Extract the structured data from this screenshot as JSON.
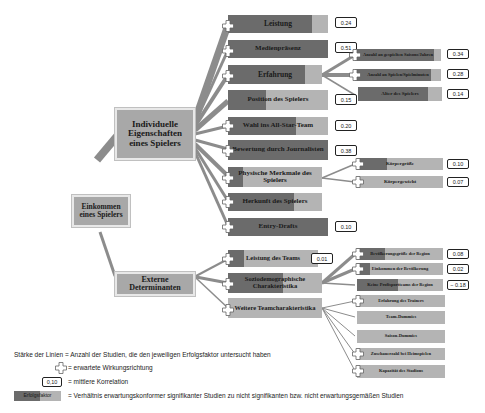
{
  "diagram": {
    "root": {
      "label": "Einkommen eines Spielers"
    },
    "branches": [
      {
        "label": "Individuelle Eigenschaften eines Spielers",
        "children": [
          {
            "label": "Leistung",
            "correlation": "0.24",
            "expected_direction": true
          },
          {
            "label": "Medienpräsenz",
            "correlation": "0.51",
            "expected_direction": true
          },
          {
            "label": "Erfahrung",
            "correlation": null,
            "expected_direction": true,
            "children": [
              {
                "label": "Anzahl an gespielten Saisons/Jahren",
                "correlation": "0.34",
                "expected_direction": true
              },
              {
                "label": "Anzahl an Spielen/Spielminuten",
                "correlation": "0.28",
                "expected_direction": true
              },
              {
                "label": "Alter des Spielers",
                "correlation": "0.14",
                "expected_direction": false
              }
            ]
          },
          {
            "label": "Position des Spielers",
            "correlation": "0.15",
            "expected_direction": false
          },
          {
            "label": "Wahl ins All-Star-Team",
            "correlation": "0.20",
            "expected_direction": true
          },
          {
            "label": "Bewertung durch Journalisten",
            "correlation": "0.38",
            "expected_direction": true
          },
          {
            "label": "Physische Merkmale des Spielers",
            "correlation": null,
            "expected_direction": true,
            "children": [
              {
                "label": "Körpergröße",
                "correlation": "0.10",
                "expected_direction": true
              },
              {
                "label": "Körpergewicht",
                "correlation": "0.07",
                "expected_direction": true
              }
            ]
          },
          {
            "label": "Herkunft des Spielers",
            "correlation": null,
            "expected_direction": true
          },
          {
            "label": "Entry-Drafts",
            "correlation": "0.10",
            "expected_direction": true
          }
        ]
      },
      {
        "label": "Externe Determinanten",
        "children": [
          {
            "label": "Leistung des Teams",
            "correlation": "0.01",
            "expected_direction": true
          },
          {
            "label": "Soziodemographische Charakteristika",
            "correlation": null,
            "expected_direction": true,
            "children": [
              {
                "label": "Bevölkerungsgröße der Region",
                "correlation": "0.08",
                "expected_direction": true
              },
              {
                "label": "Einkommen der Bevölkerung",
                "correlation": "0.02",
                "expected_direction": true
              },
              {
                "label": "Keine Profisportteams der Region",
                "correlation": "-0.18",
                "expected_direction": true
              }
            ]
          },
          {
            "label": "Weitere Teamcharakteristika",
            "correlation": null,
            "expected_direction": true,
            "children": [
              {
                "label": "Erfahrung des Trainers",
                "correlation": null,
                "expected_direction": true
              },
              {
                "label": "Team-Dummies",
                "correlation": null,
                "expected_direction": false
              },
              {
                "label": "Saison-Dummies",
                "correlation": null,
                "expected_direction": false
              },
              {
                "label": "Zuschauerzahl bei Heimspielen",
                "correlation": null,
                "expected_direction": true
              },
              {
                "label": "Kapazität des Stadions",
                "correlation": null,
                "expected_direction": true
              }
            ]
          }
        ]
      }
    ]
  },
  "legend": {
    "line_strength": "Stärke der Linien = Anzahl der Studien, die den jeweiligen Erfolgsfaktor untersucht haben",
    "plus_text": "= erwartete Wirkungsrichtung",
    "badge_sample": "0,10",
    "badge_text": "= mittlere Korrelation",
    "bar_sample": "Erfolgsfaktor",
    "bar_text": "= Verhältnis erwartungskonformer signifikanter Studien zu nicht signifikanten bzw. nicht erwartungsgemäßen Studien"
  },
  "labels": {
    "root": "Einkommen eines Spielers",
    "ind": "Individuelle Eigenschaften eines Spielers",
    "ext": "Externe Determinanten",
    "n_leistung": "Leistung",
    "v_leistung": "0.24",
    "n_medien": "Medienpräsenz",
    "v_medien": "0.51",
    "n_erfahrung": "Erfahrung",
    "n_saisons": "Anzahl an gespielten Saisons/Jahren",
    "v_saisons": "0.34",
    "n_spiele": "Anzahl an Spielen/Spielminuten",
    "v_spiele": "0.28",
    "n_alter": "Alter des Spielers",
    "v_alter": "0.14",
    "n_position": "Position des Spielers",
    "v_position": "0.15",
    "n_allstar": "Wahl ins All-Star-Team",
    "v_allstar": "0.20",
    "n_journal": "Bewertung durch Journalisten",
    "v_journal": "0.38",
    "n_physisch": "Physische Merkmale des Spielers",
    "n_groesse": "Körpergröße",
    "v_groesse": "0.10",
    "n_gewicht": "Körpergewicht",
    "v_gewicht": "0.07",
    "n_herkunft": "Herkunft des Spielers",
    "n_draft": "Entry-Drafts",
    "v_draft": "0.10",
    "n_teamleistung": "Leistung des Teams",
    "v_teamleistung": "0.01",
    "n_sozio": "Soziodemographische Charakteristika",
    "n_bevoelk": "Bevölkerungsgröße der Region",
    "v_bevoelk": "0.08",
    "n_einkommen": "Einkommen der Bevölkerung",
    "v_einkommen": "0.02",
    "n_profi": "Keine Profisportteams der Region",
    "v_profi": "− 0.18",
    "n_weitere": "Weitere Teamcharakteristika",
    "n_trainer": "Erfahrung des Trainers",
    "n_teamd": "Team-Dummies",
    "n_saisond": "Saison-Dummies",
    "n_zuschauer": "Zuschauerzahl bei Heimspielen",
    "n_kapaz": "Kapazität des Stadions"
  }
}
